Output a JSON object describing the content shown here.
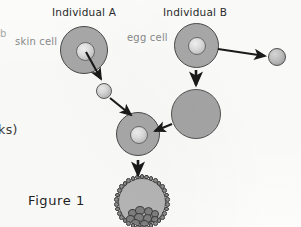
{
  "figure": {
    "caption": "Figure 1",
    "title_left": "Individual A",
    "title_right": "Individual B",
    "margin_fragment_left_top": "b",
    "margin_fragment_left_mid": "ks)"
  },
  "labels": {
    "skin_cell": "skin cell",
    "egg_cell": "egg cell"
  },
  "diagram": {
    "type": "flow-diagram",
    "nodes": [
      {
        "id": "skin-cell",
        "name": "skin cell",
        "shape": "cell-with-nucleus",
        "cx": 84,
        "cy": 50,
        "r": 24,
        "nucleus_r": 9.5
      },
      {
        "id": "skin-nucleus",
        "name": "extracted skin nucleus",
        "shape": "sphere",
        "cx": 104,
        "cy": 91,
        "r": 8
      },
      {
        "id": "egg-cell",
        "name": "egg cell",
        "shape": "cell-with-nucleus",
        "cx": 196,
        "cy": 45,
        "r": 22.5,
        "nucleus_r": 9
      },
      {
        "id": "egg-nucleus",
        "name": "removed egg nucleus",
        "shape": "sphere",
        "cx": 277,
        "cy": 57,
        "r": 9
      },
      {
        "id": "enucleated-egg",
        "name": "enucleated egg cell",
        "shape": "plain-cell",
        "cx": 196,
        "cy": 114,
        "r": 25
      },
      {
        "id": "fused-cell",
        "name": "fused reconstructed cell",
        "shape": "cell-with-nucleus",
        "cx": 138,
        "cy": 134,
        "r": 22,
        "nucleus_r": 9
      },
      {
        "id": "blastocyst",
        "name": "blastocyst",
        "shape": "blastocyst",
        "cx": 142,
        "cy": 202,
        "r": 24
      }
    ],
    "edges": [
      {
        "from": "skin-cell",
        "to": "skin-nucleus",
        "style": "solid-arrow"
      },
      {
        "from": "skin-nucleus",
        "to": "fused-cell",
        "style": "solid-arrow"
      },
      {
        "from": "egg-cell",
        "to": "egg-nucleus",
        "style": "solid-arrow"
      },
      {
        "from": "egg-cell",
        "to": "enucleated-egg",
        "style": "solid-arrow"
      },
      {
        "from": "enucleated-egg",
        "to": "fused-cell",
        "style": "solid-arrow"
      },
      {
        "from": "fused-cell",
        "to": "blastocyst",
        "style": "solid-arrow"
      }
    ]
  },
  "colors": {
    "cell_fill": "#a9a9a9",
    "cell_outline": "#4a4a4a",
    "nucleus_fill": "#e0e0e0",
    "arrow": "#1a1a1a",
    "label_text": "#8a8a8a",
    "heading_text": "#2b2b2b",
    "background": "#fdfdfc"
  }
}
